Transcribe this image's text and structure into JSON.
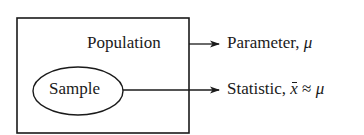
{
  "diagram": {
    "population_box": {
      "label": "Population"
    },
    "sample_ellipse": {
      "label": "Sample"
    },
    "outputs": [
      {
        "name": "parameter",
        "text": "Parameter, ",
        "symbol": "μ"
      },
      {
        "name": "statistic",
        "text": "Statistic, ",
        "symbol_xbar": "x",
        "approx": " ≈ ",
        "symbol": "μ"
      }
    ],
    "colors": {
      "stroke": "#1a1a1a",
      "background": "#ffffff"
    }
  }
}
